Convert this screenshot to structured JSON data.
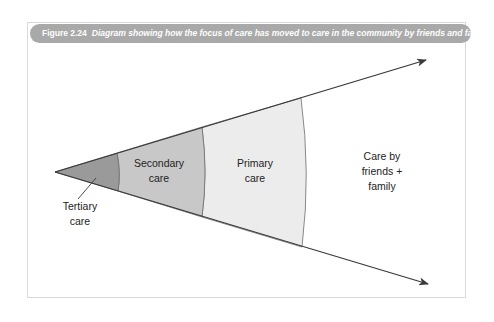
{
  "figure": {
    "number": "Figure 2.24",
    "caption": "Diagram showing how the focus of care has moved to care in the community by friends and family",
    "caption_bar_color": "#a9a9a9",
    "caption_text_color": "#fdfdfd",
    "frame_border_color": "#d9d9d9",
    "background_color": "#ffffff"
  },
  "diagram": {
    "type": "expanding-cone",
    "apex": {
      "x": 55,
      "y": 172
    },
    "outline_color": "#3a3a3a",
    "bands": [
      {
        "id": "tertiary",
        "label_line_1": "Tertiary",
        "label_line_2": "care",
        "fill": "#9a9a9a",
        "label_position": "outside-below-left",
        "label_x": 80,
        "label_y_line1": 206,
        "label_y_line2": 220,
        "leader_from": {
          "x": 78,
          "y": 199
        },
        "leader_to": {
          "x": 96,
          "y": 178
        }
      },
      {
        "id": "secondary",
        "label_line_1": "Secondary",
        "label_line_2": "care",
        "fill": "#c8c8c8",
        "label_position": "inside",
        "label_x": 159,
        "label_y_line1": 167,
        "label_y_line2": 182
      },
      {
        "id": "primary",
        "label_line_1": "Primary",
        "label_line_2": "care",
        "fill": "#ececec",
        "label_position": "inside",
        "label_x": 255,
        "label_y_line1": 167,
        "label_y_line2": 182
      },
      {
        "id": "community",
        "label_line_1": "Care by",
        "label_line_2": "friends +",
        "label_line_3": "family",
        "fill": "#ffffff",
        "label_position": "inside",
        "label_x": 382,
        "label_y_line1": 160,
        "label_y_line2": 175,
        "label_y_line3": 190
      }
    ],
    "arrows": [
      {
        "id": "upper-arrow",
        "from": {
          "x": 55,
          "y": 172
        },
        "to": {
          "x": 433,
          "y": 57
        },
        "arrowhead": true
      },
      {
        "id": "lower-arrow",
        "from": {
          "x": 55,
          "y": 172
        },
        "to": {
          "x": 435,
          "y": 286
        },
        "arrowhead": true
      }
    ],
    "dividing_arcs": [
      {
        "id": "tertiary-secondary-boundary",
        "top": {
          "x": 117,
          "y": 153
        },
        "mid": {
          "x": 121,
          "y": 173
        },
        "bottom": {
          "x": 118,
          "y": 191
        }
      },
      {
        "id": "secondary-primary-boundary",
        "top": {
          "x": 202,
          "y": 127
        },
        "mid": {
          "x": 208,
          "y": 173
        },
        "bottom": {
          "x": 202,
          "y": 217
        }
      },
      {
        "id": "primary-community-boundary",
        "top": {
          "x": 301,
          "y": 98
        },
        "mid": {
          "x": 311,
          "y": 173
        },
        "bottom": {
          "x": 302,
          "y": 247
        }
      }
    ]
  }
}
